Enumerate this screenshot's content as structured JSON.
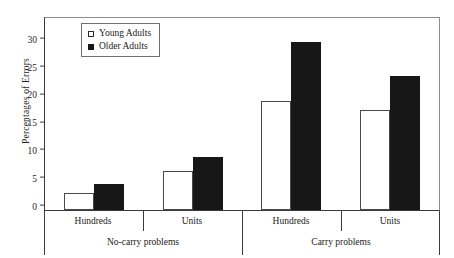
{
  "chart_data": {
    "type": "bar",
    "title": "",
    "xlabel": "",
    "ylabel": "Percentages of Errors",
    "ylim": [
      0,
      34.5
    ],
    "yticks": [
      0,
      5,
      10,
      15,
      20,
      25,
      30
    ],
    "grid": false,
    "legend_position": "top-left",
    "legend": [
      "Young Adults",
      "Older Adults"
    ],
    "group_labels": [
      "No-carry problems",
      "Carry problems"
    ],
    "categories": [
      "Hundreds",
      "Units",
      "Hundreds",
      "Units"
    ],
    "series": [
      {
        "name": "Young Adults",
        "values": [
          3.1,
          7.1,
          19.5,
          17.9
        ]
      },
      {
        "name": "Older Adults",
        "values": [
          4.6,
          9.6,
          30.2,
          24.0
        ]
      }
    ]
  },
  "legend": {
    "young": {
      "label": "Young Adults",
      "swatch": "open-square-icon",
      "color": "#ffffff"
    },
    "older": {
      "label": "Older Adults",
      "swatch": "filled-square-icon",
      "color": "#171717"
    }
  },
  "axis": {
    "y_title": "Percentages of Errors",
    "y_ticks": [
      "30",
      "25",
      "20",
      "15",
      "10",
      "5",
      "0"
    ],
    "sub_labels": [
      "Hundreds",
      "Units",
      "Hundreds",
      "Units"
    ],
    "group_labels": [
      "No-carry problems",
      "Carry problems"
    ]
  }
}
